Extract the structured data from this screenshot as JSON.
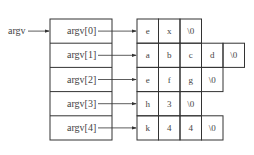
{
  "diagram": {
    "pointer_label": "argv",
    "pointer_array": [
      "argv[0]",
      "argv[1]",
      "argv[2]",
      "argv[3]",
      "argv[4]"
    ],
    "strings": [
      [
        "e",
        "x",
        "\\0"
      ],
      [
        "a",
        "b",
        "c",
        "d",
        "\\0"
      ],
      [
        "e",
        "f",
        "g",
        "\\0"
      ],
      [
        "h",
        "3",
        "\\0"
      ],
      [
        "k",
        "4",
        "4",
        "\\0"
      ]
    ],
    "colors": {
      "line": "#333333",
      "text": "#444444",
      "background": "#ffffff"
    }
  }
}
